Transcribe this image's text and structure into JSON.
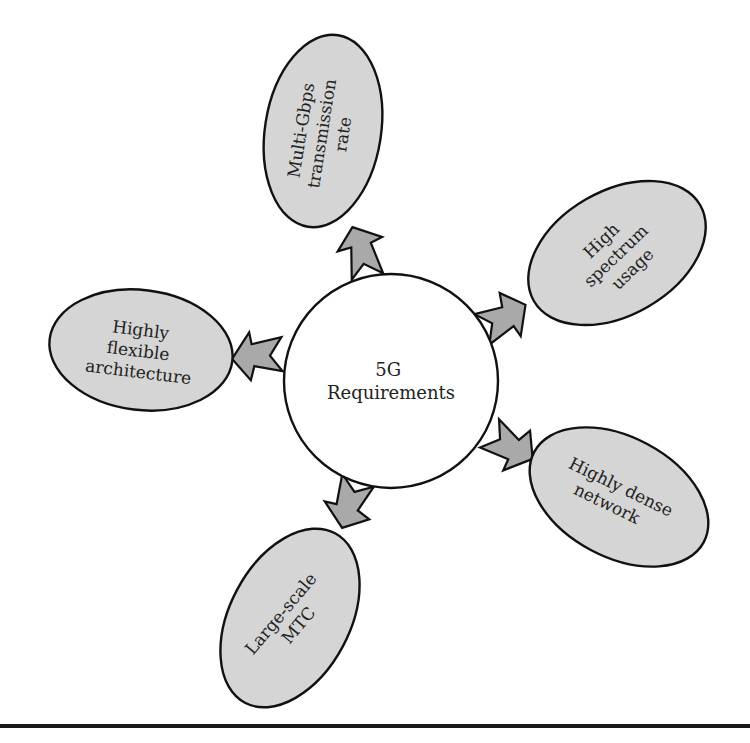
{
  "diagram": {
    "hub": {
      "lines": [
        "5G",
        "Requirements"
      ]
    },
    "nodes": [
      {
        "id": "multi-gbps",
        "lines": [
          "Multi-Gbps",
          "transmission",
          "rate"
        ]
      },
      {
        "id": "high-spectrum",
        "lines": [
          "High",
          "spectrum",
          "usage"
        ]
      },
      {
        "id": "dense-network",
        "lines": [
          "Highly dense",
          "network"
        ]
      },
      {
        "id": "large-scale-mtc",
        "lines": [
          "Large-scale",
          "MTC"
        ]
      },
      {
        "id": "flexible-architecture",
        "lines": [
          "Highly",
          "flexible",
          "architecture"
        ]
      }
    ],
    "colors": {
      "node_fill": "#d5d5d5",
      "arrow_fill": "#a9a9a9",
      "hub_fill": "#ffffff",
      "outline": "#111111",
      "text": "#222222"
    }
  }
}
